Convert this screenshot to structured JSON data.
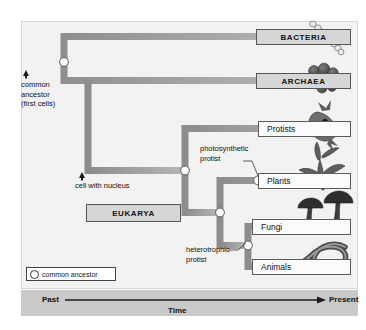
{
  "diagram": {
    "background_color": "#f2f2f2",
    "branch_color": "#9a9a9a",
    "node_fill": "#ffffff",
    "node_stroke": "#555555"
  },
  "domains": [
    {
      "id": "bacteria",
      "label": "BACTERIA",
      "organism_icon": "bacteria-chain-icon"
    },
    {
      "id": "archaea",
      "label": "ARCHAEA",
      "organism_icon": "archaea-cluster-icon"
    },
    {
      "id": "eukarya",
      "label": "EUKARYA",
      "organism_icon": ""
    }
  ],
  "taxa": [
    {
      "id": "protists",
      "label": "Protists",
      "organism_icon": "protist-icon"
    },
    {
      "id": "plants",
      "label": "Plants",
      "organism_icon": "plant-icon"
    },
    {
      "id": "fungi",
      "label": "Fungi",
      "organism_icon": "mushroom-icon"
    },
    {
      "id": "animals",
      "label": "Animals",
      "organism_icon": "worm-icon"
    }
  ],
  "callouts": [
    {
      "id": "common-ancestor",
      "text": "common\nancestor\n(first cells)",
      "has_arrow": true
    },
    {
      "id": "cell-with-nucleus",
      "text": "cell with nucleus",
      "has_arrow": true
    },
    {
      "id": "photosynthetic-protist",
      "text": "photosynthetic\nprotist",
      "has_arrow": false
    },
    {
      "id": "heterotrophic-protist",
      "text": "heterotrophic\nprotist",
      "has_arrow": false
    }
  ],
  "legend": {
    "label": "common ancestor",
    "symbol": "open-circle"
  },
  "axis": {
    "left_label": "Past",
    "right_label": "Present",
    "center_label": "Time",
    "direction": "left-to-right"
  },
  "nodes": [
    {
      "id": "root-node",
      "name": "first-common-ancestor"
    },
    {
      "id": "eukarya-node",
      "name": "eukaryote-ancestor"
    },
    {
      "id": "plants-node",
      "name": "plant-ancestor"
    },
    {
      "id": "fungi-animals-node",
      "name": "opisthokont-ancestor"
    },
    {
      "id": "fungi-animals-split",
      "name": "fungi-animals-ancestor"
    }
  ]
}
